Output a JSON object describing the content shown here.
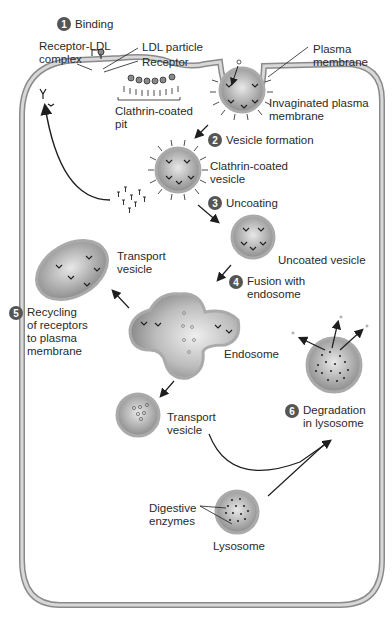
{
  "diagram": {
    "colors": {
      "membrane": "#c8c8c8",
      "membrane_edge": "#8a8a8a",
      "vesicle_fill": "#9a9a9a",
      "vesicle_light": "#e6e6e6",
      "ink": "#1e1e1e",
      "badge": "#555555"
    },
    "steps": [
      {
        "number": "1",
        "label": "Binding"
      },
      {
        "number": "2",
        "label": "Vesicle formation"
      },
      {
        "number": "3",
        "label": "Uncoating"
      },
      {
        "number": "4",
        "label": "Fusion with\nendosome"
      },
      {
        "number": "5",
        "label": "Recycling\nof receptors\nto plasma\nmembrane"
      },
      {
        "number": "6",
        "label": "Degradation\nin lysosome"
      }
    ],
    "labels": {
      "receptor_ldl_complex": "Receptor-LDL\ncomplex",
      "ldl_particle": "LDL particle",
      "receptor": "Receptor",
      "clathrin_coated_pit": "Clathrin-coated\npit",
      "plasma_membrane": "Plasma\nmembrane",
      "invaginated_plasma_membrane": "Invaginated plasma\nmembrane",
      "clathrin_coated_vesicle": "Clathrin-coated\nvesicle",
      "uncoated_vesicle": "Uncoated vesicle",
      "transport_vesicle_top": "Transport\nvesicle",
      "endosome": "Endosome",
      "transport_vesicle_bottom": "Transport\nvesicle",
      "digestive_enzymes": "Digestive\nenzymes",
      "lysosome": "Lysosome"
    }
  }
}
